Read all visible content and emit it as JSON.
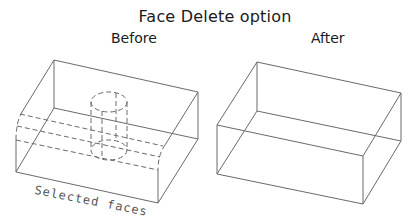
{
  "title": "Face Delete option",
  "panels": [
    {
      "label": "Before",
      "annotation": "Selected faces",
      "description": "Isometric wireframe box with a vertical cylindrical hole and a rounded slot; selected faces shown dashed"
    },
    {
      "label": "After",
      "description": "Isometric wireframe box with the selected faces removed (plain box)"
    }
  ],
  "colors": {
    "line": "#6a6a6a",
    "text": "#1a1a1a",
    "background": "#ffffff"
  }
}
